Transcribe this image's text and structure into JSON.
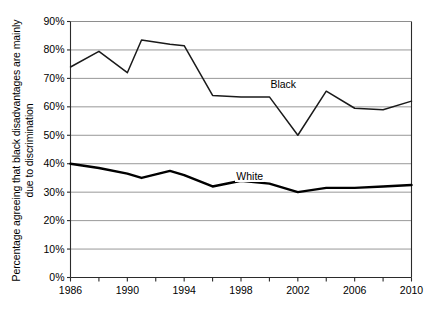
{
  "chart_data": {
    "type": "line",
    "title": "",
    "xlabel": "",
    "ylabel": "Percentage agreeing that black disadvantages are mainly due to discrimination",
    "xlim": [
      1986,
      2010
    ],
    "ylim": [
      0,
      90
    ],
    "grid": true,
    "legend_position": "inline-labels",
    "ytick_labels": [
      "90%",
      "80%",
      "70%",
      "60%",
      "50%",
      "40%",
      "30%",
      "20%",
      "10%",
      "0%"
    ],
    "ytick_values": [
      90,
      80,
      70,
      60,
      50,
      40,
      30,
      20,
      10,
      0
    ],
    "xtick_labels": [
      "1986",
      "1990",
      "1994",
      "1998",
      "2002",
      "2006",
      "2010"
    ],
    "xtick_values": [
      1986,
      1990,
      1994,
      1998,
      2002,
      2006,
      2010
    ],
    "x": [
      1986,
      1988,
      1990,
      1991,
      1993,
      1994,
      1996,
      1998,
      2000,
      2002,
      2004,
      2006,
      2008,
      2010
    ],
    "series": [
      {
        "name": "Black",
        "color": "#1a1a1a",
        "label_x": 2000,
        "label_y": 68,
        "values": [
          74,
          79.5,
          72,
          83.5,
          82,
          81.5,
          64,
          63.5,
          63.5,
          50,
          65.5,
          59.5,
          59,
          62
        ]
      },
      {
        "name": "White",
        "color": "#000000",
        "label_x": 1997.6,
        "label_y": 35.5,
        "values": [
          40,
          38.5,
          36.5,
          35,
          37.5,
          36,
          32,
          34,
          33,
          30,
          31.5,
          31.5,
          32,
          32.5
        ]
      }
    ]
  },
  "axis": {
    "y_title": "Percentage agreeing that black disadvantages are mainly due to discrimination"
  }
}
